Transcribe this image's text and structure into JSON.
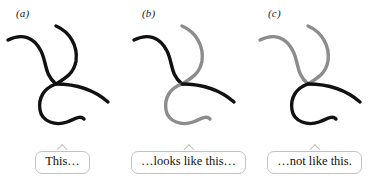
{
  "figure": {
    "background": "#ffffff",
    "width": 377,
    "height": 180,
    "colors": {
      "dark_strand": "#111111",
      "light_strand": "#8c8c8c",
      "bubble_border": "#c2c2c2",
      "bubble_fill": "#ffffff",
      "text": "#111111"
    },
    "panels": [
      {
        "id": "a",
        "label": "(a)",
        "caption": "This…",
        "caption_name": "bubble-caption-a",
        "strands": [
          {
            "name": "upper-left-arm",
            "color": "dark"
          },
          {
            "name": "upper-right-arm",
            "color": "dark"
          },
          {
            "name": "lower-left-hook",
            "color": "dark"
          },
          {
            "name": "lower-right-branch",
            "color": "dark"
          }
        ]
      },
      {
        "id": "b",
        "label": "(b)",
        "caption": "…looks like this…",
        "caption_name": "bubble-caption-b",
        "strands": [
          {
            "name": "upper-left-arm",
            "color": "dark"
          },
          {
            "name": "upper-right-arm",
            "color": "light"
          },
          {
            "name": "lower-left-hook",
            "color": "light"
          },
          {
            "name": "lower-right-branch",
            "color": "dark"
          }
        ]
      },
      {
        "id": "c",
        "label": "(c)",
        "caption": "…not like this.",
        "caption_name": "bubble-caption-c",
        "strands": [
          {
            "name": "upper-left-arm",
            "color": "light"
          },
          {
            "name": "upper-right-arm",
            "color": "light"
          },
          {
            "name": "lower-left-hook",
            "color": "dark"
          },
          {
            "name": "lower-right-branch",
            "color": "dark"
          }
        ]
      }
    ]
  }
}
